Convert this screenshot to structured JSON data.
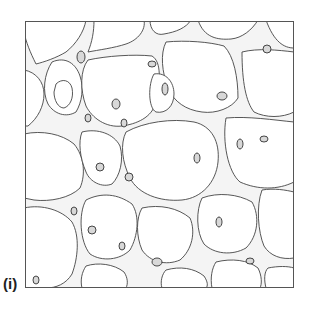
{
  "figure": {
    "panel_label": "(i)",
    "colors": {
      "outline": "#444444",
      "nucleus": "#333333",
      "background": "#ffffff",
      "septa": "#f2f2f2"
    }
  }
}
